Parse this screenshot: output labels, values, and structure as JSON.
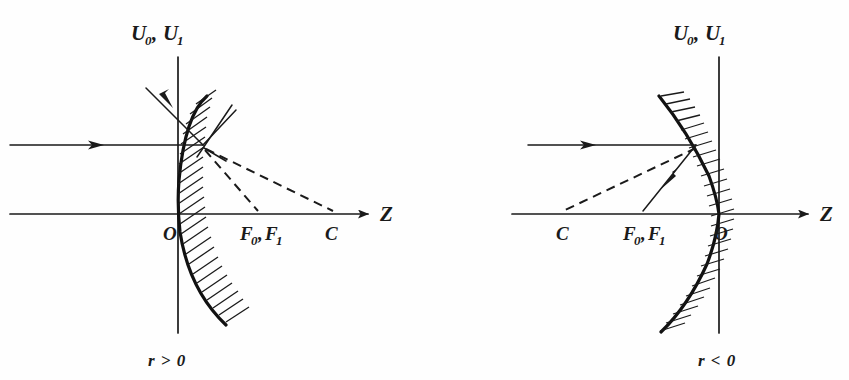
{
  "figure": {
    "background_color": "#fefefe",
    "ink_color": "#1a1a1a",
    "panels": [
      {
        "id": "left-panel",
        "name": "concave-mirror-r-positive",
        "vertical_axis_label": "ℨ₀, ℨ₁",
        "vertical_axis_label_main": "U",
        "vertical_axis_label_sub_a": "0",
        "vertical_axis_label_sub_b": "1",
        "vertical_axis_label_main_b": "U",
        "horizontal_axis_label": "Z",
        "origin_label": "O",
        "focus_label_main_a": "F",
        "focus_label_sub_a": "0",
        "focus_label_sep": ",",
        "focus_label_main_b": "F",
        "focus_label_sub_b": "1",
        "center_label": "C",
        "condition_label": "r > 0",
        "points": {
          "origin_x": 178,
          "focus_x": 258,
          "center_x": 333,
          "axis_y": 214,
          "vertex_top_y": 57,
          "vertex_bottom_y": 333,
          "axis_left_x": 10,
          "axis_arrow_x": 372,
          "hit_point_x": 203,
          "hit_point_y": 145
        }
      },
      {
        "id": "right-panel",
        "name": "convex-mirror-r-negative",
        "vertical_axis_label": "ℨ₀, ℨ₁",
        "vertical_axis_label_main": "U",
        "vertical_axis_label_sub_a": "0",
        "vertical_axis_label_sub_b": "1",
        "vertical_axis_label_main_b": "U",
        "horizontal_axis_label": "Z",
        "origin_label": "O",
        "focus_label_main_a": "F",
        "focus_label_sub_a": "0",
        "focus_label_sep": ",",
        "focus_label_main_b": "F",
        "focus_label_sub_b": "1",
        "center_label": "C",
        "condition_label": "r < 0",
        "points": {
          "origin_x": 720,
          "focus_x": 643,
          "center_x": 563,
          "axis_y": 214,
          "vertex_top_y": 57,
          "vertex_bottom_y": 333,
          "axis_left_x": 512,
          "axis_arrow_x": 812,
          "hit_point_x": 696,
          "hit_point_y": 145
        }
      }
    ],
    "legend": {
      "solid_ray_meaning": "incident and reflected ray",
      "dashed_ray_meaning": "construction line to focus and center"
    }
  }
}
